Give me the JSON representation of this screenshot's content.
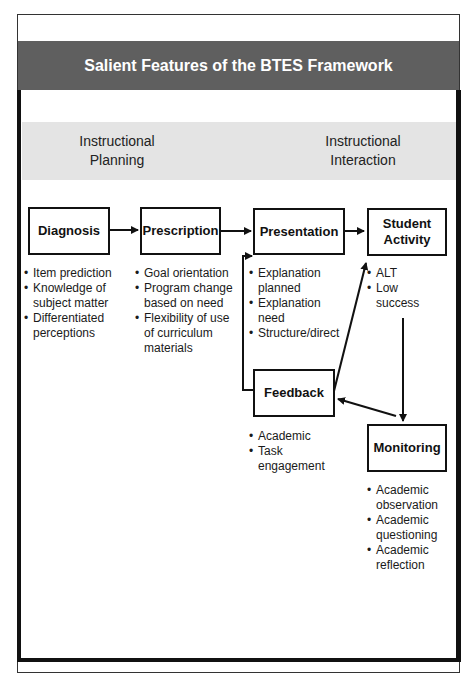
{
  "header": {
    "title": "Salient Features of the BTES Framework",
    "band_color": "#5f5f5f"
  },
  "phases": {
    "planning": {
      "line1": "Instructional",
      "line2": "Planning"
    },
    "interaction": {
      "line1": "Instructional",
      "line2": "Interaction"
    },
    "band_color": "#e4e4e4"
  },
  "nodes": {
    "diagnosis": {
      "label": "Diagnosis",
      "bullets": [
        "Item prediction",
        "Knowledge of subject matter",
        "Differentiated perceptions"
      ]
    },
    "prescription": {
      "label": "Prescription",
      "bullets": [
        "Goal orientation",
        "Program change based on need",
        "Flexibility of use of curriculum materials"
      ]
    },
    "presentation": {
      "label": "Presentation",
      "bullets": [
        "Explanation planned",
        "Explanation need",
        "Structure/direct"
      ]
    },
    "student_activity": {
      "label_line1": "Student",
      "label_line2": "Activity",
      "bullets": [
        "ALT",
        "Low success"
      ]
    },
    "feedback": {
      "label": "Feedback",
      "bullets": [
        "Academic",
        "Task engagement"
      ]
    },
    "monitoring": {
      "label": "Monitoring",
      "bullets": [
        "Academic observation",
        "Academic questioning",
        "Academic reflection"
      ]
    }
  },
  "edges": [
    {
      "from": "Diagnosis",
      "to": "Prescription"
    },
    {
      "from": "Prescription",
      "to": "Presentation"
    },
    {
      "from": "Presentation",
      "to": "Student Activity"
    },
    {
      "from": "Student Activity",
      "to": "Monitoring"
    },
    {
      "from": "Monitoring",
      "to": "Feedback"
    },
    {
      "from": "Feedback",
      "to": "Student Activity"
    },
    {
      "from": "Feedback",
      "to": "Presentation"
    }
  ]
}
